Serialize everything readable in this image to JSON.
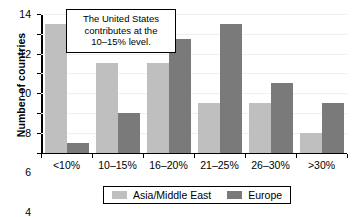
{
  "chart_data": {
    "type": "bar",
    "title": "",
    "xlabel": "",
    "ylabel": "Number of countries",
    "categories": [
      "<10%",
      "10–15%",
      "16–20%",
      "21–25%",
      "26–30%",
      ">30%"
    ],
    "series": [
      {
        "name": "Asia/Middle East",
        "color": "#bfbfbf",
        "values": [
          13,
          9,
          9,
          5,
          5,
          2
        ]
      },
      {
        "name": "Europe",
        "color": "#7a7a7a",
        "values": [
          1,
          4,
          11.5,
          13,
          7,
          5
        ]
      }
    ],
    "ylim": [
      0,
      14
    ],
    "yticks": [
      0,
      2,
      4,
      6,
      8,
      10,
      12,
      14
    ],
    "ytick_labels": [
      "0",
      "2",
      "4",
      "6",
      "8",
      "10",
      "12",
      "14"
    ],
    "grid": true,
    "legend_position": "bottom",
    "annotations": [
      {
        "text": "The United States contributes at the 10–15% level."
      }
    ]
  },
  "legend": {
    "items": [
      {
        "label": "Asia/Middle East"
      },
      {
        "label": "Europe"
      }
    ]
  },
  "callout": {
    "line1": "The United States",
    "line2": "contributes at the",
    "line3": "10–15% level."
  }
}
